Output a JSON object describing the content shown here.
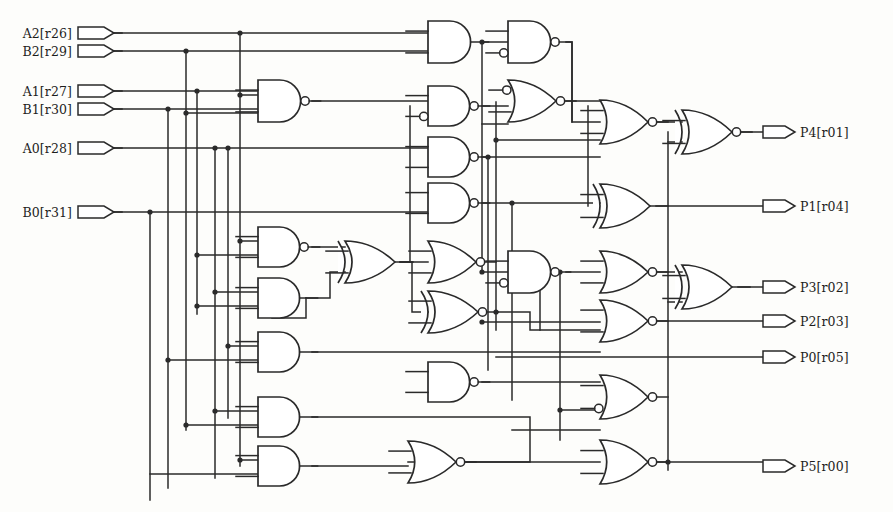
{
  "diagram": {
    "type": "digital-logic-schematic",
    "colors": {
      "wire": "#2a2a2a",
      "gate_fill": "#ffffff",
      "background": "#fdfdfb",
      "text": "#1d1d1d"
    }
  },
  "inputs": [
    {
      "id": "in-a2",
      "label": "A2[r26]",
      "signal": "A2",
      "register": "r26",
      "x": 112,
      "y": 33
    },
    {
      "id": "in-b2",
      "label": "B2[r29]",
      "signal": "B2",
      "register": "r29",
      "x": 112,
      "y": 51
    },
    {
      "id": "in-a1",
      "label": "A1[r27]",
      "signal": "A1",
      "register": "r27",
      "x": 112,
      "y": 91
    },
    {
      "id": "in-b1",
      "label": "B1[r30]",
      "signal": "B1",
      "register": "r30",
      "x": 112,
      "y": 109
    },
    {
      "id": "in-a0",
      "label": "A0[r28]",
      "signal": "A0",
      "register": "r28",
      "x": 112,
      "y": 148
    },
    {
      "id": "in-b0",
      "label": "B0[r31]",
      "signal": "B0",
      "register": "r31",
      "x": 112,
      "y": 212
    }
  ],
  "outputs": [
    {
      "id": "out-p4",
      "label": "P4[r01]",
      "signal": "P4",
      "register": "r01",
      "x": 775,
      "y": 132
    },
    {
      "id": "out-p1",
      "label": "P1[r04]",
      "signal": "P1",
      "register": "r04",
      "x": 775,
      "y": 206
    },
    {
      "id": "out-p3",
      "label": "P3[r02]",
      "signal": "P3",
      "register": "r02",
      "x": 775,
      "y": 287
    },
    {
      "id": "out-p2",
      "label": "P2[r03]",
      "signal": "P2",
      "register": "r03",
      "x": 775,
      "y": 321
    },
    {
      "id": "out-p0",
      "label": "P0[r05]",
      "signal": "P0",
      "register": "r05",
      "x": 775,
      "y": 357
    },
    {
      "id": "out-p5",
      "label": "P5[r00]",
      "signal": "P5",
      "register": "r00",
      "x": 775,
      "y": 466
    }
  ],
  "gates": [
    {
      "id": "g1",
      "type": "and",
      "x": 428,
      "y": 42,
      "w": 48,
      "h": 42,
      "inputs": 2,
      "bubble": false
    },
    {
      "id": "g2",
      "type": "nand",
      "x": 508,
      "y": 42,
      "w": 48,
      "h": 42,
      "inputs": 2,
      "bubble": true,
      "inv_in": [
        1
      ]
    },
    {
      "id": "g3",
      "type": "nand",
      "x": 258,
      "y": 101,
      "w": 48,
      "h": 42,
      "inputs": 2,
      "bubble": true
    },
    {
      "id": "g4",
      "type": "nand",
      "x": 428,
      "y": 106,
      "w": 48,
      "h": 40,
      "inputs": 2,
      "bubble": true,
      "inv_in": [
        1
      ]
    },
    {
      "id": "g5",
      "type": "nor",
      "x": 508,
      "y": 101,
      "w": 48,
      "h": 42,
      "inputs": 2,
      "bubble": true,
      "inv_in": [
        0
      ]
    },
    {
      "id": "g6",
      "type": "nand",
      "x": 428,
      "y": 157,
      "w": 48,
      "h": 40,
      "inputs": 2,
      "bubble": true
    },
    {
      "id": "g7",
      "type": "nand",
      "x": 428,
      "y": 203,
      "w": 48,
      "h": 40,
      "inputs": 2,
      "bubble": true
    },
    {
      "id": "g8",
      "type": "nand",
      "x": 258,
      "y": 247,
      "w": 48,
      "h": 40,
      "inputs": 2,
      "bubble": true
    },
    {
      "id": "g9",
      "type": "and",
      "x": 258,
      "y": 298,
      "w": 48,
      "h": 40,
      "inputs": 2,
      "bubble": false
    },
    {
      "id": "g10",
      "type": "xor",
      "x": 345,
      "y": 262,
      "w": 50,
      "h": 42,
      "inputs": 2,
      "bubble": false
    },
    {
      "id": "g11",
      "type": "nor",
      "x": 428,
      "y": 262,
      "w": 48,
      "h": 42,
      "inputs": 2,
      "bubble": true
    },
    {
      "id": "g12",
      "type": "xnor",
      "x": 428,
      "y": 312,
      "w": 50,
      "h": 42,
      "inputs": 2,
      "bubble": true
    },
    {
      "id": "g13",
      "type": "nand",
      "x": 508,
      "y": 272,
      "w": 48,
      "h": 42,
      "inputs": 2,
      "bubble": true,
      "inv_in": [
        1
      ]
    },
    {
      "id": "g14",
      "type": "and",
      "x": 258,
      "y": 352,
      "w": 48,
      "h": 40,
      "inputs": 2,
      "bubble": false
    },
    {
      "id": "g15",
      "type": "nand",
      "x": 428,
      "y": 382,
      "w": 48,
      "h": 40,
      "inputs": 2,
      "bubble": true
    },
    {
      "id": "g16",
      "type": "and",
      "x": 258,
      "y": 417,
      "w": 48,
      "h": 40,
      "inputs": 2,
      "bubble": false
    },
    {
      "id": "g17",
      "type": "and",
      "x": 258,
      "y": 466,
      "w": 48,
      "h": 40,
      "inputs": 2,
      "bubble": false
    },
    {
      "id": "g18",
      "type": "nor",
      "x": 408,
      "y": 462,
      "w": 48,
      "h": 42,
      "inputs": 2,
      "bubble": true
    },
    {
      "id": "g19",
      "type": "nor",
      "x": 600,
      "y": 122,
      "w": 48,
      "h": 44,
      "inputs": 2,
      "bubble": true
    },
    {
      "id": "g20",
      "type": "xnor",
      "x": 682,
      "y": 132,
      "w": 50,
      "h": 44,
      "inputs": 2,
      "bubble": true
    },
    {
      "id": "g21",
      "type": "xor",
      "x": 600,
      "y": 206,
      "w": 50,
      "h": 44,
      "inputs": 2,
      "bubble": false
    },
    {
      "id": "g22",
      "type": "nor",
      "x": 600,
      "y": 272,
      "w": 48,
      "h": 42,
      "inputs": 2,
      "bubble": true
    },
    {
      "id": "g23",
      "type": "xor",
      "x": 682,
      "y": 287,
      "w": 50,
      "h": 44,
      "inputs": 2,
      "bubble": false
    },
    {
      "id": "g24",
      "type": "nor",
      "x": 600,
      "y": 321,
      "w": 48,
      "h": 42,
      "inputs": 2,
      "bubble": true
    },
    {
      "id": "g25",
      "type": "nor",
      "x": 600,
      "y": 397,
      "w": 48,
      "h": 44,
      "inputs": 2,
      "bubble": true,
      "inv_in": [
        1
      ]
    },
    {
      "id": "g26",
      "type": "nor",
      "x": 600,
      "y": 462,
      "w": 48,
      "h": 44,
      "inputs": 2,
      "bubble": true
    }
  ],
  "buses": {
    "vertical_x": [
      150,
      168,
      186,
      197,
      215,
      240,
      258
    ],
    "note": "input fan-out column positions"
  }
}
